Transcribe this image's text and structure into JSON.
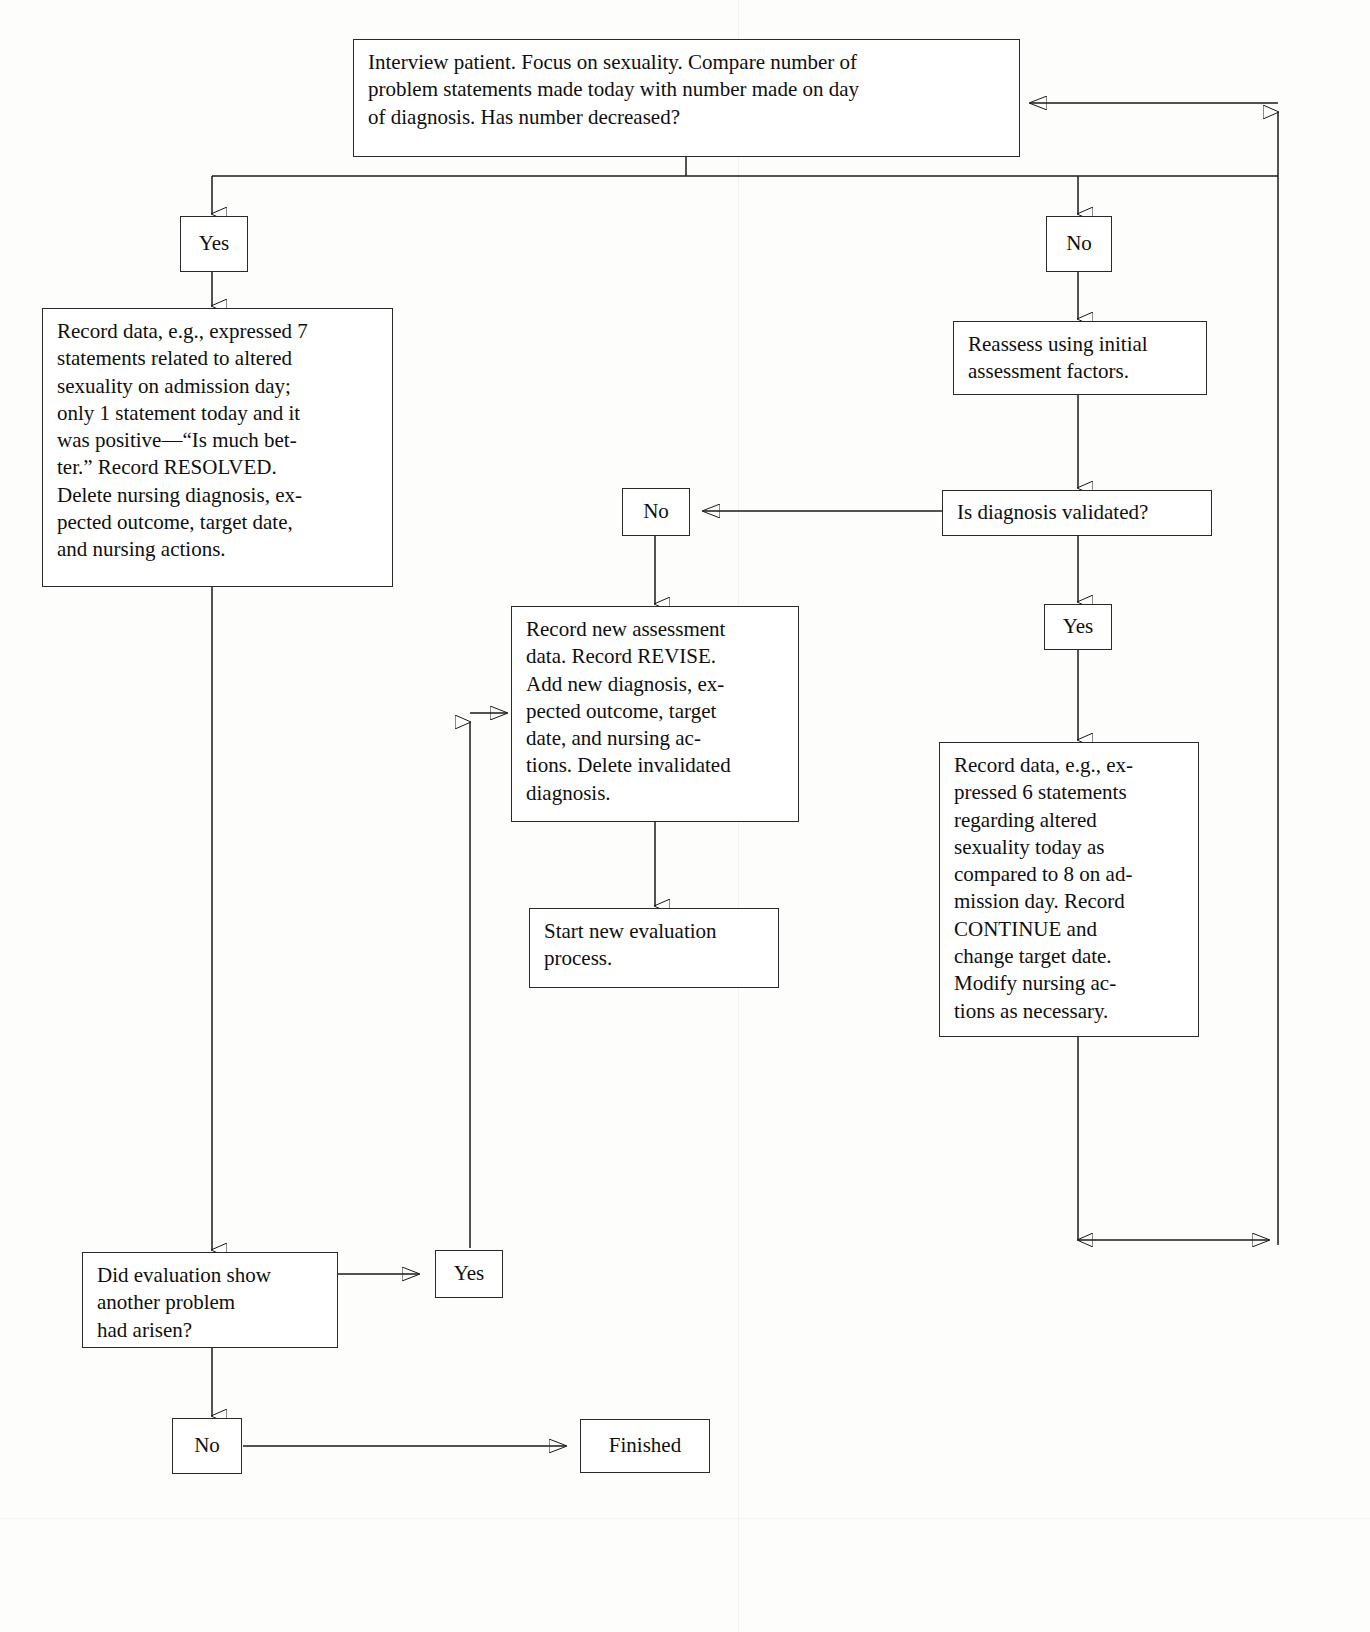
{
  "diagram": {
    "type": "flowchart",
    "line_color": "#1a1a1a",
    "box_border_color": "#2a2a2a",
    "background_color": "#fdfdfc"
  },
  "nodes": {
    "interview": {
      "id": "interview",
      "label": "Interview patient. Focus on sexuality. Compare number of\nproblem statements made today with number made on day\nof diagnosis. Has number decreased?"
    },
    "yes_top": {
      "id": "yes-top",
      "label": "Yes"
    },
    "no_top": {
      "id": "no-top",
      "label": "No"
    },
    "record_resolved": {
      "id": "record-resolved",
      "label": "Record data, e.g., expressed 7\nstatements related to altered\nsexuality on admission day;\nonly 1 statement today and it\nwas positive—“Is much bet-\nter.”  Record RESOLVED.\nDelete nursing diagnosis, ex-\npected outcome, target date,\nand nursing actions."
    },
    "reassess": {
      "id": "reassess",
      "label": "Reassess using initial\nassessment factors."
    },
    "is_validated": {
      "id": "is-diagnosis-validated",
      "label": "Is diagnosis validated?"
    },
    "no_validated": {
      "id": "no-validated",
      "label": "No"
    },
    "yes_validated": {
      "id": "yes-validated",
      "label": "Yes"
    },
    "record_revise": {
      "id": "record-revise",
      "label": "Record new assessment\ndata. Record REVISE.\nAdd new diagnosis, ex-\npected outcome, target\ndate, and nursing ac-\ntions. Delete invalidated\ndiagnosis."
    },
    "record_continue": {
      "id": "record-continue",
      "label": "Record data, e.g., ex-\npressed 6 statements\nregarding altered\nsexuality today as\ncompared to 8 on ad-\nmission day.  Record\nCONTINUE and\nchange target date.\nModify nursing ac-\ntions as necessary."
    },
    "start_new": {
      "id": "start-new-evaluation",
      "label": "Start new evaluation\nprocess."
    },
    "did_evaluation": {
      "id": "did-evaluation-show-another-problem",
      "label": "Did evaluation show\nanother problem\nhad arisen?"
    },
    "yes_another": {
      "id": "yes-another-problem",
      "label": "Yes"
    },
    "no_another": {
      "id": "no-another-problem",
      "label": "No"
    },
    "finished": {
      "id": "finished",
      "label": "Finished"
    }
  },
  "edges": [
    {
      "from": "interview",
      "to": "yes_top",
      "label": "Yes"
    },
    {
      "from": "interview",
      "to": "no_top",
      "label": "No"
    },
    {
      "from": "yes_top",
      "to": "record_resolved",
      "label": ""
    },
    {
      "from": "no_top",
      "to": "reassess",
      "label": ""
    },
    {
      "from": "reassess",
      "to": "is_validated",
      "label": ""
    },
    {
      "from": "is_validated",
      "to": "no_validated",
      "label": "No"
    },
    {
      "from": "is_validated",
      "to": "yes_validated",
      "label": "Yes"
    },
    {
      "from": "no_validated",
      "to": "record_revise",
      "label": ""
    },
    {
      "from": "yes_validated",
      "to": "record_continue",
      "label": ""
    },
    {
      "from": "record_revise",
      "to": "start_new",
      "label": ""
    },
    {
      "from": "record_resolved",
      "to": "did_evaluation",
      "label": ""
    },
    {
      "from": "did_evaluation",
      "to": "yes_another",
      "label": "Yes"
    },
    {
      "from": "did_evaluation",
      "to": "no_another",
      "label": "No"
    },
    {
      "from": "yes_another",
      "to": "record_revise",
      "label": ""
    },
    {
      "from": "no_another",
      "to": "finished",
      "label": ""
    },
    {
      "from": "record_continue",
      "to": "interview",
      "label": ""
    }
  ]
}
